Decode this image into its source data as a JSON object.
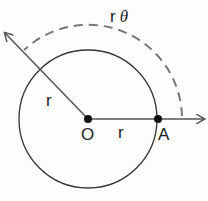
{
  "diagram": {
    "title_label": "r",
    "arc_label_r": "r",
    "arc_label_theta": "θ",
    "radius_label_upper": "r",
    "radius_label_lower": "r",
    "center_label": "O",
    "point_label": "A",
    "colors": {
      "stroke": "#333333",
      "dash": "#666666"
    }
  }
}
